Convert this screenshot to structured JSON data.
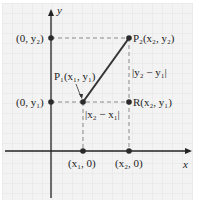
{
  "diagram": {
    "axes": {
      "x_label": "x",
      "y_label": "y"
    },
    "points": {
      "P1": {
        "label": "P₁(x₁, y₁)",
        "x": 83,
        "y": 102
      },
      "P2": {
        "label": "P₂(x₂, y₂)",
        "x": 129,
        "y": 38
      },
      "R": {
        "label": "R(x₂, y₁)",
        "x": 129,
        "y": 102
      },
      "y2_axis": {
        "label": "(0, y₂)",
        "x": 51,
        "y": 38
      },
      "y1_axis": {
        "label": "(0, y₁)",
        "x": 51,
        "y": 102
      },
      "x1_axis": {
        "label": "(x₁, 0)",
        "x": 83,
        "y": 151
      },
      "x2_axis": {
        "label": "(x₂, 0)",
        "x": 129,
        "y": 151
      }
    },
    "distances": {
      "horizontal": "|x₂ − x₁|",
      "vertical": "|y₂ − y₁|"
    },
    "colors": {
      "grid_bg": "#f2f2f2",
      "grid_line": "#e2e2e2",
      "axis": "#222222",
      "segment": "#333333",
      "dashed": "#888888",
      "point": "#2a2a2a"
    }
  }
}
